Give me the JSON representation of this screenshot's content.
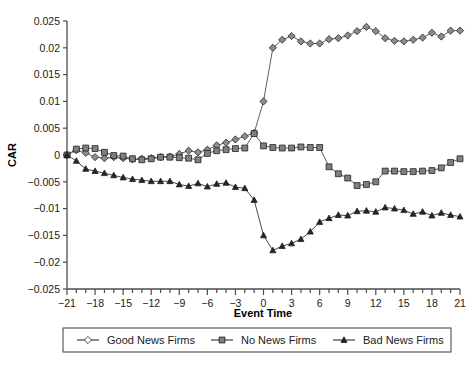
{
  "chart_data": {
    "type": "line",
    "title": "",
    "xlabel": "Event Time",
    "ylabel": "CAR",
    "xlim": [
      -21,
      21
    ],
    "ylim": [
      -0.025,
      0.025
    ],
    "grid": false,
    "legend_position": "bottom",
    "x": [
      -21,
      -20,
      -19,
      -18,
      -17,
      -16,
      -15,
      -14,
      -13,
      -12,
      -11,
      -10,
      -9,
      -8,
      -7,
      -6,
      -5,
      -4,
      -3,
      -2,
      -1,
      0,
      1,
      2,
      3,
      4,
      5,
      6,
      7,
      8,
      9,
      10,
      11,
      12,
      13,
      14,
      15,
      16,
      17,
      18,
      19,
      20,
      21
    ],
    "x_tick_labels": [
      "-21",
      "-18",
      "-15",
      "-12",
      "-9",
      "-6",
      "-3",
      "0",
      "3",
      "6",
      "9",
      "12",
      "15",
      "18",
      "21"
    ],
    "x_tick_values": [
      -21,
      -18,
      -15,
      -12,
      -9,
      -6,
      -3,
      0,
      3,
      6,
      9,
      12,
      15,
      18,
      21
    ],
    "y_tick_labels": [
      "0.025",
      "0.02",
      "0.015",
      "0.01",
      "0.005",
      "0",
      "-0.005",
      "-0.01",
      "-0.015",
      "-0.02",
      "-0.025"
    ],
    "y_tick_values": [
      0.025,
      0.02,
      0.015,
      0.01,
      0.005,
      0,
      -0.005,
      -0.01,
      -0.015,
      -0.02,
      -0.025
    ],
    "series": [
      {
        "name": "Good News Firms",
        "marker": "diamond",
        "color": "#8c8c8c",
        "line_color": "#4d4d4d",
        "values": [
          0.0,
          0.0009,
          0.0004,
          -0.0004,
          -0.0006,
          -0.0004,
          -0.0006,
          -0.0008,
          -0.0007,
          -0.0006,
          -0.0004,
          -0.0003,
          0.0002,
          0.0008,
          0.0005,
          0.001,
          0.0018,
          0.0023,
          0.0029,
          0.0035,
          0.0041,
          0.01,
          0.02,
          0.0215,
          0.0222,
          0.0212,
          0.0208,
          0.0208,
          0.0216,
          0.0218,
          0.0223,
          0.0231,
          0.0239,
          0.0231,
          0.0218,
          0.0213,
          0.0212,
          0.0215,
          0.0219,
          0.0228,
          0.0221,
          0.0232,
          0.0232
        ]
      },
      {
        "name": "No News Firms",
        "marker": "square",
        "color": "#808080",
        "line_color": "#4d4d4d",
        "values": [
          0.0,
          0.0011,
          0.0013,
          0.0012,
          0.0005,
          -0.0001,
          -0.0002,
          -0.0007,
          -0.0009,
          -0.0007,
          -0.0004,
          -0.0004,
          -0.0005,
          -0.0006,
          -0.0009,
          0.0003,
          0.0008,
          0.001,
          0.0012,
          0.0013,
          0.004,
          0.0017,
          0.0014,
          0.0013,
          0.0013,
          0.0015,
          0.0014,
          0.0014,
          -0.0022,
          -0.0035,
          -0.0043,
          -0.0057,
          -0.0055,
          -0.005,
          -0.003,
          -0.003,
          -0.0031,
          -0.0031,
          -0.003,
          -0.0029,
          -0.0024,
          -0.0014,
          -0.0007
        ]
      },
      {
        "name": "Bad News Firms",
        "marker": "triangle",
        "color": "#262626",
        "line_color": "#333333",
        "values": [
          0.0,
          -0.0011,
          -0.0026,
          -0.003,
          -0.0034,
          -0.0038,
          -0.0042,
          -0.0045,
          -0.0047,
          -0.0049,
          -0.0049,
          -0.0049,
          -0.0055,
          -0.0058,
          -0.0053,
          -0.0059,
          -0.0054,
          -0.0052,
          -0.006,
          -0.0062,
          -0.0084,
          -0.015,
          -0.0178,
          -0.017,
          -0.0165,
          -0.0157,
          -0.0143,
          -0.0125,
          -0.0118,
          -0.0112,
          -0.0113,
          -0.0105,
          -0.0104,
          -0.0106,
          -0.0098,
          -0.01,
          -0.0103,
          -0.011,
          -0.0106,
          -0.0113,
          -0.0108,
          -0.0112,
          -0.0115
        ]
      }
    ]
  },
  "legend": {
    "items": [
      {
        "label": "Good News Firms",
        "marker": "diamond"
      },
      {
        "label": "No News Firms",
        "marker": "square"
      },
      {
        "label": "Bad News Firms",
        "marker": "triangle"
      }
    ]
  }
}
